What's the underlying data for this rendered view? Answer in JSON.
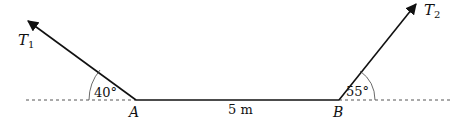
{
  "diagram": {
    "forces": [
      {
        "name": "T",
        "subscript": "1",
        "angle_label": "40°",
        "angle_deg": 40
      },
      {
        "name": "T",
        "subscript": "2",
        "angle_label": "55°",
        "angle_deg": 55
      }
    ],
    "points": [
      {
        "label": "A"
      },
      {
        "label": "B"
      }
    ],
    "distance_label": "5 m",
    "colors": {
      "line": "#111111",
      "dashed": "#555555"
    }
  }
}
